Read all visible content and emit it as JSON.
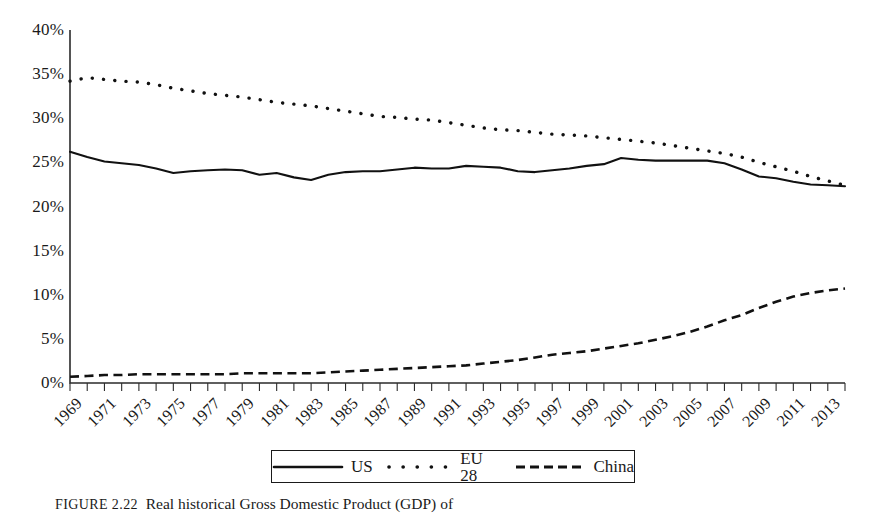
{
  "figure": {
    "caption_tag": "FIGURE",
    "caption_number": "2.22",
    "caption_text": "Real historical Gross Domestic Product (GDP) of"
  },
  "legend": {
    "position": "bottom-center",
    "entries": [
      {
        "label": "US",
        "style": "solid",
        "icon": "solid-line-icon"
      },
      {
        "label": "EU 28",
        "style": "dotted",
        "icon": "dotted-line-icon"
      },
      {
        "label": "China",
        "style": "dashed",
        "icon": "dashed-line-icon"
      }
    ]
  },
  "chart_data": {
    "type": "line",
    "title": "",
    "xlabel": "",
    "ylabel": "",
    "grid": false,
    "legend_position": "bottom-center",
    "ylim": [
      0,
      40
    ],
    "xlim": [
      1969,
      2014
    ],
    "y_tick_labels": [
      "40%",
      "35%",
      "30%",
      "25%",
      "20%",
      "15%",
      "10%",
      "5%",
      "0%"
    ],
    "y_ticks": [
      40,
      35,
      30,
      25,
      20,
      15,
      10,
      5,
      0
    ],
    "y_unit": "%",
    "x_tick_labels": [
      "1969",
      "1971",
      "1973",
      "1975",
      "1977",
      "1979",
      "1981",
      "1983",
      "1985",
      "1987",
      "1989",
      "1991",
      "1993",
      "1995",
      "1997",
      "1999",
      "2001",
      "2003",
      "2005",
      "2007",
      "2009",
      "2011",
      "2013"
    ],
    "x": [
      1969,
      1970,
      1971,
      1972,
      1973,
      1974,
      1975,
      1976,
      1977,
      1978,
      1979,
      1980,
      1981,
      1982,
      1983,
      1984,
      1985,
      1986,
      1987,
      1988,
      1989,
      1990,
      1991,
      1992,
      1993,
      1994,
      1995,
      1996,
      1997,
      1998,
      1999,
      2000,
      2001,
      2002,
      2003,
      2004,
      2005,
      2006,
      2007,
      2008,
      2009,
      2010,
      2011,
      2012,
      2013,
      2014
    ],
    "series": [
      {
        "name": "US",
        "style": "solid",
        "values": [
          26.2,
          25.6,
          25.1,
          24.9,
          24.7,
          24.3,
          23.8,
          24.0,
          24.1,
          24.2,
          24.1,
          23.6,
          23.8,
          23.3,
          23.0,
          23.6,
          23.9,
          24.0,
          24.0,
          24.2,
          24.4,
          24.3,
          24.3,
          24.6,
          24.5,
          24.4,
          24.0,
          23.9,
          24.1,
          24.3,
          24.6,
          24.8,
          25.5,
          25.3,
          25.2,
          25.2,
          25.2,
          25.2,
          24.9,
          24.2,
          23.4,
          23.2,
          22.8,
          22.5,
          22.4,
          22.3
        ]
      },
      {
        "name": "EU 28",
        "style": "dotted",
        "values": [
          34.2,
          34.6,
          34.4,
          34.2,
          34.1,
          33.8,
          33.4,
          33.1,
          32.8,
          32.6,
          32.4,
          32.1,
          31.8,
          31.6,
          31.4,
          31.1,
          30.8,
          30.5,
          30.2,
          30.1,
          29.9,
          29.8,
          29.5,
          29.2,
          28.9,
          28.7,
          28.6,
          28.4,
          28.2,
          28.1,
          28.0,
          27.8,
          27.6,
          27.4,
          27.2,
          26.9,
          26.6,
          26.3,
          26.0,
          25.6,
          25.0,
          24.5,
          24.0,
          23.4,
          22.9,
          22.4
        ]
      },
      {
        "name": "China",
        "style": "dashed",
        "values": [
          0.7,
          0.8,
          0.9,
          0.9,
          1.0,
          1.0,
          1.0,
          1.0,
          1.0,
          1.0,
          1.1,
          1.1,
          1.1,
          1.1,
          1.1,
          1.2,
          1.3,
          1.4,
          1.5,
          1.6,
          1.7,
          1.8,
          1.9,
          2.0,
          2.2,
          2.4,
          2.6,
          2.9,
          3.2,
          3.4,
          3.6,
          3.9,
          4.2,
          4.5,
          4.9,
          5.3,
          5.8,
          6.4,
          7.1,
          7.7,
          8.5,
          9.2,
          9.8,
          10.2,
          10.5,
          10.7
        ]
      }
    ]
  }
}
